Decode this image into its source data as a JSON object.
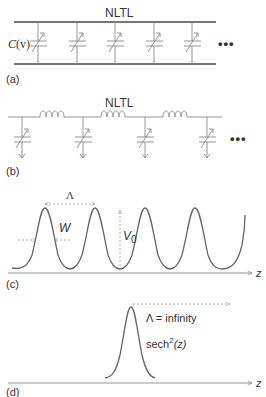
{
  "panels": {
    "a": {
      "label": "(a)",
      "title": "NLTL",
      "cap_label_C": "C",
      "cap_label_arg": "(v)",
      "ellipsis": "•••",
      "cap_positions_x": [
        38,
        77,
        115,
        154,
        192
      ]
    },
    "b": {
      "label": "(b)",
      "title": "NLTL",
      "ellipsis": "•••",
      "cap_positions_x": [
        22,
        83,
        145,
        207
      ]
    },
    "c": {
      "label": "(c)",
      "lambda": "Λ",
      "width": "W",
      "amplitude": "V",
      "amplitude_sub": "0",
      "axis": "z"
    },
    "d": {
      "label": "(d)",
      "lambda_text": "Λ = infinity",
      "sech": "sech",
      "sech_sup": "2",
      "sech_arg": "(z)",
      "axis": "z"
    }
  },
  "colors": {
    "line": "#777777",
    "curve": "#666666",
    "text": "#333333",
    "dashed": "#999999"
  }
}
